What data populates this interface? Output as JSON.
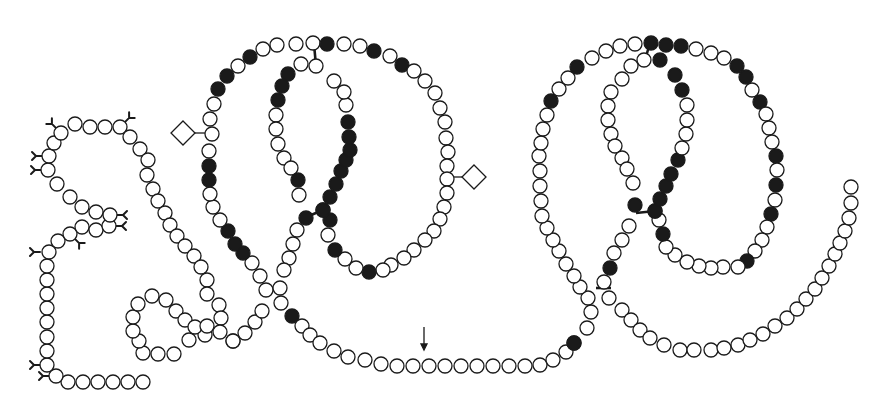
{
  "figure": {
    "type": "protein residue chain diagram",
    "bead_radius": 7,
    "colors": {
      "stroke": "#1a1a1a",
      "open_fill": "#ffffff",
      "filled_fill": "#1a1a1a",
      "background": "#ffffff"
    }
  },
  "segments": [
    {
      "name": "n-terminal-hook",
      "points": [
        [
          143,
          382
        ],
        [
          128,
          382
        ],
        [
          113,
          382
        ],
        [
          98,
          382
        ],
        [
          83,
          382
        ],
        [
          68,
          382
        ],
        [
          56,
          376
        ],
        [
          47,
          365
        ],
        [
          47,
          351
        ],
        [
          47,
          337
        ],
        [
          47,
          322
        ],
        [
          47,
          308
        ],
        [
          47,
          294
        ],
        [
          47,
          280
        ],
        [
          47,
          266
        ],
        [
          49,
          252
        ],
        [
          58,
          241
        ],
        [
          70,
          234
        ],
        [
          82,
          227
        ],
        [
          96,
          230
        ],
        [
          109,
          226
        ],
        [
          110,
          215
        ],
        [
          96,
          212
        ],
        [
          82,
          207
        ],
        [
          70,
          197
        ],
        [
          57,
          184
        ],
        [
          48,
          170
        ],
        [
          49,
          156
        ],
        [
          54,
          143
        ],
        [
          61,
          133
        ],
        [
          75,
          124
        ],
        [
          90,
          127
        ],
        [
          105,
          127
        ],
        [
          120,
          127
        ],
        [
          130,
          137
        ],
        [
          140,
          149
        ],
        [
          148,
          160
        ],
        [
          147,
          175
        ],
        [
          153,
          189
        ],
        [
          158,
          201
        ],
        [
          165,
          213
        ],
        [
          170,
          225
        ],
        [
          177,
          236
        ],
        [
          185,
          246
        ],
        [
          194,
          256
        ],
        [
          201,
          267
        ],
        [
          207,
          280
        ],
        [
          207,
          294
        ],
        [
          219,
          305
        ],
        [
          221,
          318
        ],
        [
          220,
          332
        ],
        [
          205,
          335
        ],
        [
          189,
          340
        ],
        [
          174,
          354
        ],
        [
          158,
          354
        ],
        [
          143,
          353
        ],
        [
          139,
          341
        ],
        [
          133,
          331
        ],
        [
          133,
          317
        ],
        [
          138,
          304
        ],
        [
          152,
          296
        ],
        [
          166,
          300
        ],
        [
          176,
          311
        ],
        [
          185,
          320
        ],
        [
          195,
          327
        ],
        [
          207,
          326
        ],
        [
          233,
          341
        ]
      ],
      "filled": [
        68
      ]
    },
    {
      "name": "left-outer-loop",
      "points": [
        [
          233,
          341
        ],
        [
          245,
          333
        ],
        [
          255,
          322
        ],
        [
          262,
          311
        ],
        [
          266,
          290
        ],
        [
          260,
          276
        ],
        [
          252,
          263
        ],
        [
          243,
          253
        ],
        [
          235,
          244
        ],
        [
          228,
          231
        ],
        [
          220,
          220
        ],
        [
          213,
          207
        ],
        [
          210,
          194
        ],
        [
          209,
          180
        ],
        [
          209,
          166
        ],
        [
          209,
          151
        ],
        [
          212,
          134
        ],
        [
          210,
          119
        ],
        [
          214,
          104
        ],
        [
          218,
          89
        ],
        [
          227,
          76
        ],
        [
          238,
          66
        ],
        [
          250,
          57
        ],
        [
          263,
          49
        ],
        [
          277,
          45
        ],
        [
          296,
          44
        ],
        [
          313,
          43
        ],
        [
          327,
          44
        ],
        [
          344,
          44
        ],
        [
          360,
          46
        ],
        [
          374,
          51
        ],
        [
          390,
          56
        ],
        [
          402,
          65
        ],
        [
          414,
          71
        ],
        [
          425,
          81
        ],
        [
          435,
          93
        ],
        [
          440,
          108
        ],
        [
          445,
          122
        ],
        [
          446,
          138
        ],
        [
          448,
          152
        ],
        [
          447,
          166
        ],
        [
          447,
          179
        ],
        [
          447,
          193
        ],
        [
          444,
          207
        ],
        [
          440,
          219
        ],
        [
          434,
          231
        ],
        [
          425,
          240
        ],
        [
          414,
          250
        ],
        [
          404,
          258
        ],
        [
          391,
          265
        ],
        [
          383,
          270
        ],
        [
          369,
          272
        ],
        [
          356,
          268
        ],
        [
          345,
          259
        ],
        [
          335,
          250
        ],
        [
          328,
          235
        ],
        [
          330,
          220
        ],
        [
          323,
          210
        ]
      ],
      "filled": [
        7,
        8,
        9,
        13,
        14,
        19,
        20,
        22,
        27,
        30,
        32,
        51,
        54,
        56,
        58
      ]
    },
    {
      "name": "left-inner-loop",
      "points": [
        [
          323,
          210
        ],
        [
          330,
          197
        ],
        [
          336,
          184
        ],
        [
          341,
          171
        ],
        [
          346,
          160
        ],
        [
          350,
          150
        ],
        [
          349,
          137
        ],
        [
          348,
          122
        ],
        [
          346,
          105
        ],
        [
          344,
          92
        ],
        [
          334,
          81
        ],
        [
          316,
          66
        ],
        [
          301,
          64
        ],
        [
          288,
          74
        ],
        [
          282,
          86
        ],
        [
          278,
          100
        ],
        [
          276,
          115
        ],
        [
          276,
          129
        ],
        [
          278,
          144
        ],
        [
          284,
          158
        ],
        [
          291,
          168
        ],
        [
          298,
          180
        ],
        [
          299,
          195
        ],
        [
          306,
          218
        ],
        [
          297,
          230
        ],
        [
          293,
          244
        ],
        [
          289,
          258
        ],
        [
          284,
          270
        ],
        [
          280,
          288
        ],
        [
          281,
          303
        ],
        [
          292,
          316
        ],
        [
          302,
          326
        ],
        [
          310,
          335
        ],
        [
          320,
          343
        ],
        [
          334,
          351
        ],
        [
          348,
          357
        ],
        [
          365,
          360
        ],
        [
          381,
          364
        ],
        [
          397,
          366
        ],
        [
          413,
          366
        ],
        [
          429,
          366
        ],
        [
          445,
          366
        ],
        [
          461,
          366
        ],
        [
          477,
          366
        ],
        [
          493,
          366
        ],
        [
          509,
          366
        ],
        [
          525,
          366
        ],
        [
          540,
          365
        ],
        [
          553,
          360
        ],
        [
          566,
          352
        ],
        [
          574,
          343
        ]
      ],
      "filled": [
        0,
        1,
        2,
        3,
        4,
        5,
        6,
        7,
        13,
        14,
        15,
        21,
        23,
        30
      ]
    },
    {
      "name": "right-outer-loop",
      "points": [
        [
          574,
          343
        ],
        [
          587,
          328
        ],
        [
          591,
          312
        ],
        [
          588,
          298
        ],
        [
          580,
          287
        ],
        [
          574,
          276
        ],
        [
          566,
          264
        ],
        [
          559,
          251
        ],
        [
          553,
          240
        ],
        [
          547,
          228
        ],
        [
          542,
          216
        ],
        [
          541,
          201
        ],
        [
          540,
          186
        ],
        [
          540,
          171
        ],
        [
          539,
          156
        ],
        [
          541,
          143
        ],
        [
          543,
          129
        ],
        [
          547,
          115
        ],
        [
          551,
          101
        ],
        [
          559,
          89
        ],
        [
          568,
          78
        ],
        [
          577,
          67
        ],
        [
          592,
          58
        ],
        [
          606,
          51
        ],
        [
          620,
          46
        ],
        [
          635,
          44
        ],
        [
          651,
          43
        ],
        [
          666,
          45
        ],
        [
          681,
          46
        ],
        [
          696,
          49
        ],
        [
          711,
          53
        ],
        [
          724,
          58
        ],
        [
          737,
          66
        ],
        [
          746,
          77
        ],
        [
          752,
          90
        ],
        [
          760,
          102
        ],
        [
          766,
          114
        ],
        [
          769,
          128
        ],
        [
          772,
          142
        ],
        [
          776,
          156
        ],
        [
          777,
          170
        ],
        [
          776,
          185
        ],
        [
          775,
          200
        ],
        [
          771,
          214
        ],
        [
          767,
          227
        ],
        [
          762,
          240
        ],
        [
          755,
          251
        ],
        [
          747,
          261
        ],
        [
          738,
          267
        ],
        [
          723,
          267
        ],
        [
          711,
          268
        ],
        [
          699,
          266
        ],
        [
          687,
          262
        ],
        [
          675,
          255
        ],
        [
          666,
          247
        ],
        [
          663,
          234
        ],
        [
          659,
          220
        ],
        [
          655,
          211
        ]
      ],
      "filled": [
        0,
        18,
        21,
        26,
        27,
        28,
        32,
        33,
        35,
        39,
        41,
        43,
        47,
        55
      ]
    },
    {
      "name": "right-inner-loop",
      "points": [
        [
          655,
          211
        ],
        [
          660,
          199
        ],
        [
          666,
          186
        ],
        [
          671,
          174
        ],
        [
          678,
          160
        ],
        [
          682,
          148
        ],
        [
          686,
          134
        ],
        [
          687,
          120
        ],
        [
          687,
          105
        ],
        [
          682,
          90
        ],
        [
          675,
          75
        ],
        [
          660,
          60
        ],
        [
          644,
          60
        ],
        [
          631,
          66
        ],
        [
          622,
          79
        ],
        [
          611,
          92
        ],
        [
          608,
          106
        ],
        [
          608,
          120
        ],
        [
          611,
          134
        ],
        [
          615,
          146
        ],
        [
          622,
          158
        ],
        [
          627,
          169
        ],
        [
          633,
          183
        ],
        [
          635,
          205
        ],
        [
          629,
          226
        ],
        [
          622,
          240
        ],
        [
          614,
          253
        ],
        [
          610,
          268
        ],
        [
          604,
          282
        ],
        [
          609,
          298
        ],
        [
          622,
          310
        ],
        [
          631,
          320
        ],
        [
          640,
          330
        ],
        [
          650,
          338
        ],
        [
          664,
          345
        ],
        [
          680,
          350
        ],
        [
          694,
          350
        ],
        [
          711,
          350
        ],
        [
          724,
          348
        ],
        [
          738,
          345
        ],
        [
          750,
          340
        ],
        [
          763,
          334
        ],
        [
          775,
          326
        ],
        [
          787,
          318
        ],
        [
          797,
          309
        ],
        [
          806,
          299
        ],
        [
          815,
          289
        ],
        [
          822,
          278
        ],
        [
          829,
          266
        ],
        [
          835,
          254
        ],
        [
          840,
          243
        ],
        [
          845,
          231
        ],
        [
          849,
          218
        ],
        [
          851,
          203
        ],
        [
          851,
          187
        ]
      ],
      "filled": [
        0,
        1,
        2,
        3,
        4,
        9,
        10,
        11,
        23,
        27
      ]
    }
  ],
  "disulfide_bonds": [
    [
      [
        314,
        44
      ],
      [
        316,
        66
      ]
    ],
    [
      [
        304,
        218
      ],
      [
        323,
        210
      ]
    ],
    [
      [
        264,
        288
      ],
      [
        280,
        288
      ]
    ],
    [
      [
        650,
        43
      ],
      [
        645,
        60
      ]
    ],
    [
      [
        636,
        213
      ],
      [
        655,
        211
      ]
    ],
    [
      [
        596,
        288
      ],
      [
        611,
        288
      ]
    ]
  ],
  "glycans": [
    {
      "at": [
        61,
        133
      ],
      "dir": "up-left"
    },
    {
      "at": [
        120,
        127
      ],
      "dir": "up-right"
    },
    {
      "at": [
        48,
        170
      ],
      "dir": "left"
    },
    {
      "at": [
        49,
        156
      ],
      "dir": "left"
    },
    {
      "at": [
        109,
        226
      ],
      "dir": "right"
    },
    {
      "at": [
        110,
        215
      ],
      "dir": "right"
    },
    {
      "at": [
        70,
        234
      ],
      "dir": "down-right"
    },
    {
      "at": [
        47,
        252
      ],
      "dir": "left"
    },
    {
      "at": [
        47,
        365
      ],
      "dir": "left"
    },
    {
      "at": [
        56,
        376
      ],
      "dir": "left"
    }
  ],
  "diamonds": [
    {
      "cx": 183,
      "cy": 133,
      "size": 12,
      "link_to": [
        210,
        133
      ]
    },
    {
      "cx": 474,
      "cy": 177,
      "size": 12,
      "link_to": [
        448,
        177
      ]
    }
  ],
  "arrow": {
    "x": 424,
    "y1": 327,
    "y2": 350
  }
}
